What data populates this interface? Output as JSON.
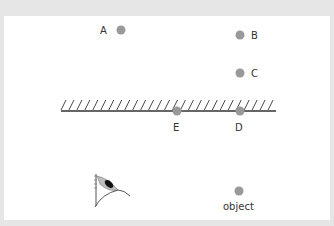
{
  "diagram": {
    "type": "plane-mirror-reflection",
    "colors": {
      "background": "#e6e6e6",
      "panel": "#ffffff",
      "point": "#999999",
      "mirror": "#333333",
      "label": "#333333"
    },
    "mirror": {
      "x1": 61,
      "x2": 276,
      "y": 111,
      "hatch_count": 27
    },
    "points": [
      {
        "id": "A",
        "label": "A",
        "cx": 121,
        "cy": 30,
        "label_x": 100,
        "label_y": 34
      },
      {
        "id": "B",
        "label": "B",
        "cx": 240,
        "cy": 35,
        "label_x": 251,
        "label_y": 39
      },
      {
        "id": "C",
        "label": "C",
        "cx": 240,
        "cy": 73,
        "label_x": 251,
        "label_y": 77
      },
      {
        "id": "E",
        "label": "E",
        "cx": 177,
        "cy": 111,
        "label_x": 173,
        "label_y": 131
      },
      {
        "id": "D",
        "label": "D",
        "cx": 240,
        "cy": 111,
        "label_x": 235,
        "label_y": 131
      },
      {
        "id": "object",
        "label": "object",
        "cx": 239,
        "cy": 191,
        "label_x": 223,
        "label_y": 210
      }
    ],
    "eye": {
      "label": "eye",
      "x": 93,
      "y": 172
    }
  }
}
